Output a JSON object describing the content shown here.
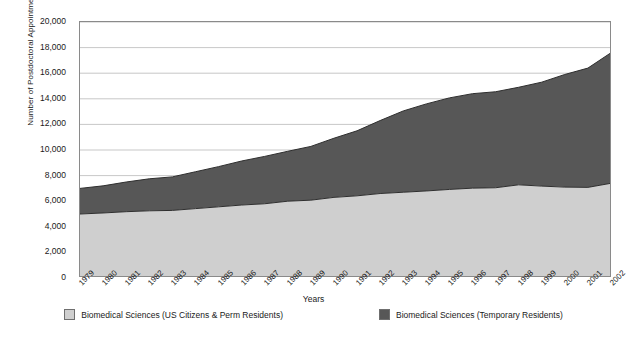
{
  "chart_data": {
    "type": "area",
    "stacked": true,
    "title": "",
    "xlabel": "Years",
    "ylabel": "Number of Postdoctoral Appointments",
    "ylim": [
      0,
      20000
    ],
    "yticks": [
      0,
      2000,
      4000,
      6000,
      8000,
      10000,
      12000,
      14000,
      16000,
      18000,
      20000
    ],
    "ytick_labels": [
      "0",
      "2,000",
      "4,000",
      "6,000",
      "8,000",
      "10,000",
      "12,000",
      "14,000",
      "16,000",
      "18,000",
      "20,000"
    ],
    "grid": true,
    "grid_axis": "y",
    "legend_position": "bottom",
    "categories": [
      "1979",
      "1980",
      "1981",
      "1982",
      "1983",
      "1984",
      "1985",
      "1986",
      "1987",
      "1988",
      "1989",
      "1990",
      "1991",
      "1992",
      "1993",
      "1994",
      "1995",
      "1996",
      "1997",
      "1998",
      "1999",
      "2000",
      "2001",
      "2002"
    ],
    "series": [
      {
        "name": "Biomedical Sciences (US Citizens & Perm Residents)",
        "color": "#cfcfcf",
        "values": [
          5000,
          5080,
          5180,
          5250,
          5280,
          5420,
          5560,
          5700,
          5800,
          6000,
          6080,
          6300,
          6420,
          6600,
          6700,
          6800,
          6920,
          7020,
          7050,
          7280,
          7180,
          7100,
          7080,
          7400
        ]
      },
      {
        "name": "Biomedical Sciences (Temporary Residents)",
        "color": "#575757",
        "values": [
          2000,
          2120,
          2320,
          2500,
          2620,
          2880,
          3140,
          3440,
          3700,
          3900,
          4200,
          4620,
          5080,
          5700,
          6350,
          6800,
          7150,
          7380,
          7500,
          7620,
          8120,
          8800,
          9320,
          10200
        ]
      }
    ],
    "totals": [
      7000,
      7200,
      7500,
      7750,
      7900,
      8300,
      8700,
      9140,
      9500,
      9900,
      10280,
      10920,
      11500,
      12300,
      13050,
      13600,
      14070,
      14400,
      14550,
      14900,
      15300,
      15900,
      16400,
      17600
    ]
  },
  "axes": {
    "y_title": "Number of Postdoctoral Appointments",
    "x_title": "Years"
  }
}
